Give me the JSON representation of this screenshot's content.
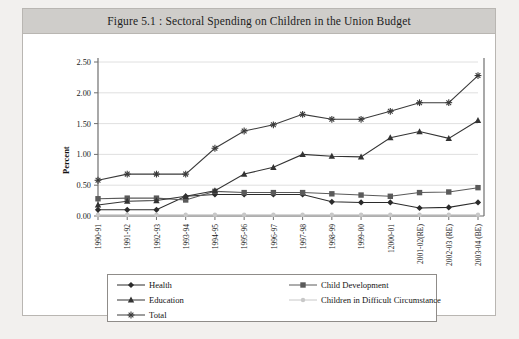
{
  "figure": {
    "title": "Figure 5.1 : Sectoral Spending on Children in the Union Budget"
  },
  "chart_data": {
    "type": "line",
    "title": "Figure 5.1 : Sectoral Spending on Children in the Union Budget",
    "xlabel": "",
    "ylabel": "Percent",
    "ylim": [
      0.0,
      2.5
    ],
    "ytick_labels": [
      "0.00",
      "0.50",
      "1.00",
      "1.50",
      "2.00",
      "2.50"
    ],
    "ytick_values": [
      0.0,
      0.5,
      1.0,
      1.5,
      2.0,
      2.5
    ],
    "grid": true,
    "legend_position": "bottom",
    "categories": [
      "1990-91",
      "1991-92",
      "1992-93",
      "1993-94",
      "1994-95",
      "1995-96",
      "1996-97",
      "1997-98",
      "1998-99",
      "1999-00",
      "12000-01",
      "2001-02(RE)",
      "2002-03 (RE)",
      "2003-04 (BE)"
    ],
    "series": [
      {
        "name": "Health",
        "marker": "diamond",
        "color": "#2b2b2b",
        "values": [
          0.1,
          0.1,
          0.1,
          0.32,
          0.35,
          0.35,
          0.35,
          0.35,
          0.23,
          0.22,
          0.22,
          0.13,
          0.14,
          0.22
        ]
      },
      {
        "name": "Child Development",
        "marker": "square",
        "color": "#5a5a5a",
        "values": [
          0.28,
          0.29,
          0.29,
          0.26,
          0.4,
          0.38,
          0.38,
          0.38,
          0.36,
          0.34,
          0.32,
          0.38,
          0.39,
          0.46
        ]
      },
      {
        "name": "Education",
        "marker": "triangle",
        "color": "#333333",
        "values": [
          0.18,
          0.24,
          0.25,
          0.32,
          0.41,
          0.68,
          0.79,
          1.0,
          0.97,
          0.96,
          1.27,
          1.37,
          1.26,
          1.55
        ]
      },
      {
        "name": "Children in Difficult Circumstance",
        "marker": "circle",
        "color": "#c8c8c8",
        "values": [
          0.02,
          0.02,
          0.02,
          0.02,
          0.02,
          0.02,
          0.02,
          0.02,
          0.02,
          0.02,
          0.02,
          0.02,
          0.02,
          0.02
        ]
      },
      {
        "name": "Total",
        "marker": "asterisk",
        "color": "#3a3a3a",
        "values": [
          0.58,
          0.68,
          0.68,
          0.68,
          1.1,
          1.38,
          1.48,
          1.65,
          1.57,
          1.57,
          1.7,
          1.84,
          1.84,
          2.28
        ]
      }
    ]
  },
  "legend": {
    "items": [
      {
        "label": "Health"
      },
      {
        "label": "Child Development"
      },
      {
        "label": "Education"
      },
      {
        "label": "Children in Difficult Circumstance"
      },
      {
        "label": "Total"
      }
    ]
  }
}
